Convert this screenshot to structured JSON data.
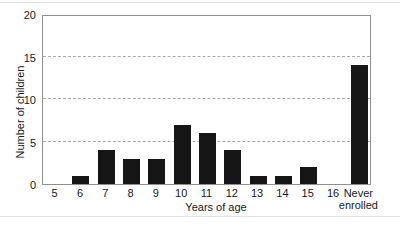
{
  "figure": {
    "background": "#ffffff",
    "bar_color": "#161616",
    "axis_border_color": "#8f8f8f",
    "gridline_color": "#ababab",
    "text_color": "#1a1a1a"
  },
  "chart_data": {
    "type": "bar",
    "title": "",
    "categories": [
      "5",
      "6",
      "7",
      "8",
      "9",
      "10",
      "11",
      "12",
      "13",
      "14",
      "15",
      "16",
      "Never enrolled"
    ],
    "values": [
      0,
      1,
      4,
      3,
      3,
      7,
      6,
      4,
      1,
      1,
      2,
      0,
      14
    ],
    "xlabel": "Years of age",
    "ylabel": "Number of children",
    "ylim": [
      0,
      20
    ],
    "yticks": [
      0,
      5,
      10,
      15,
      20
    ],
    "gridlines": [
      5,
      10,
      15
    ],
    "grid_style": "dashed",
    "legend_position": "none",
    "bar_color": "#161616"
  }
}
